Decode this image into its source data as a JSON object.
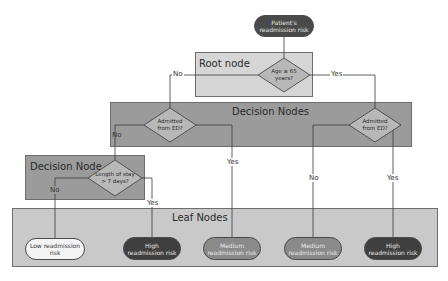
{
  "diagram": {
    "title_node": {
      "label": "Patient's readmission risk"
    },
    "sections": {
      "root": {
        "title": "Root node",
        "question": "Age ≥ 65 years?"
      },
      "decision_nodes": {
        "title": "Decision Nodes",
        "left_question": "Admitted from ED?",
        "right_question": "Admitted from ED?"
      },
      "decision_node": {
        "title": "Decision Node",
        "question": "Length of stay > 7 days?"
      },
      "leaf_nodes": {
        "title": "Leaf Nodes"
      }
    },
    "edge_labels": {
      "root_no": "No",
      "root_yes": "Yes",
      "left_ed_no": "No",
      "left_ed_yes": "Yes",
      "los_no": "No",
      "los_yes": "Yes",
      "right_ed_no": "No",
      "right_ed_yes": "Yes"
    },
    "leaves": [
      {
        "label": "Low readmission risk",
        "style": "low"
      },
      {
        "label": "High readmission risk",
        "style": "high"
      },
      {
        "label": "Medium readmission risk",
        "style": "medium"
      },
      {
        "label": "Medium readmission risk",
        "style": "medium"
      },
      {
        "label": "High readmission risk",
        "style": "high"
      }
    ],
    "colors": {
      "root_box": "#d4d4d4",
      "decision_box": "#9a9a9a",
      "leaf_box": "#c8c8c8",
      "diamond": "#b9b9b9",
      "dark_pill": "#3f3f3f",
      "medium_pill": "#8a8a8a",
      "low_pill": "#f4f4f4"
    }
  }
}
